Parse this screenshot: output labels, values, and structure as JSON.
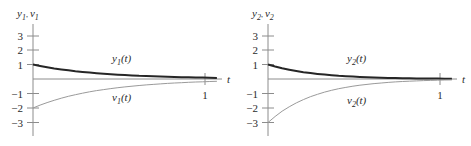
{
  "figure": {
    "title": "",
    "background_color": "#ffffff",
    "panel_count": 2
  },
  "chart_data": [
    {
      "type": "line",
      "panel_id": "left",
      "title": "",
      "xlabel": "t",
      "ylabel": "y1, v1",
      "ylabel_parts": {
        "first": "y",
        "first_sub": "1",
        "sep": ", ",
        "second": "v",
        "second_sub": "1"
      },
      "xlim": [
        0,
        1.32
      ],
      "ylim": [
        -3.4,
        3.4
      ],
      "xticks": [
        1
      ],
      "xticklabels": [
        "1"
      ],
      "yticks": [
        3,
        2,
        1,
        -1,
        -2,
        -3
      ],
      "yticklabels": [
        "3",
        "2",
        "1",
        "−1",
        "−2",
        "−3"
      ],
      "grid": false,
      "legend": "inline-annotations",
      "series": [
        {
          "name": "y1(t)",
          "name_parts": {
            "base": "y",
            "sub": "1",
            "arg": "(t)"
          },
          "color": "#262626",
          "width": 2.0,
          "annotation_x": 0.6,
          "annotation_y": 0.95,
          "x": [
            0,
            0.05,
            0.1,
            0.15,
            0.2,
            0.25,
            0.3,
            0.35,
            0.4,
            0.45,
            0.5,
            0.55,
            0.6,
            0.65,
            0.7,
            0.75,
            0.8,
            0.85,
            0.9,
            0.95,
            1.0,
            1.05,
            1.1,
            1.15,
            1.2,
            1.25,
            1.3
          ],
          "y": [
            1.0,
            0.901,
            0.813,
            0.733,
            0.662,
            0.598,
            0.541,
            0.489,
            0.443,
            0.401,
            0.364,
            0.33,
            0.3,
            0.272,
            0.247,
            0.224,
            0.204,
            0.185,
            0.168,
            0.153,
            0.139,
            0.126,
            0.115,
            0.104,
            0.095,
            0.086,
            0.078
          ]
        },
        {
          "name": "v1(t)",
          "name_parts": {
            "base": "v",
            "sub": "1",
            "arg": "(t)"
          },
          "color": "#9a9a9a",
          "width": 1.0,
          "annotation_x": 0.6,
          "annotation_y": -1.05,
          "x": [
            0,
            0.05,
            0.1,
            0.15,
            0.2,
            0.25,
            0.3,
            0.35,
            0.4,
            0.45,
            0.5,
            0.55,
            0.6,
            0.65,
            0.7,
            0.75,
            0.8,
            0.85,
            0.9,
            0.95,
            1.0,
            1.05,
            1.1,
            1.15,
            1.2,
            1.25,
            1.3
          ],
          "y": [
            -2.0,
            -1.802,
            -1.626,
            -1.466,
            -1.323,
            -1.195,
            -1.082,
            -0.978,
            -0.886,
            -0.802,
            -0.728,
            -0.66,
            -0.6,
            -0.544,
            -0.494,
            -0.448,
            -0.408,
            -0.37,
            -0.336,
            -0.306,
            -0.278,
            -0.252,
            -0.23,
            -0.208,
            -0.19,
            -0.172,
            -0.156
          ]
        }
      ]
    },
    {
      "type": "line",
      "panel_id": "right",
      "title": "",
      "xlabel": "t",
      "ylabel": "y2, v2",
      "ylabel_parts": {
        "first": "y",
        "first_sub": "2",
        "sep": ", ",
        "second": "v",
        "second_sub": "2"
      },
      "xlim": [
        0,
        1.32
      ],
      "ylim": [
        -3.4,
        3.4
      ],
      "xticks": [
        1
      ],
      "xticklabels": [
        "1"
      ],
      "yticks": [
        3,
        2,
        1,
        -1,
        -2,
        -3
      ],
      "yticklabels": [
        "3",
        "2",
        "1",
        "−1",
        "−2",
        "−3"
      ],
      "grid": false,
      "legend": "inline-annotations",
      "series": [
        {
          "name": "y2(t)",
          "name_parts": {
            "base": "y",
            "sub": "2",
            "arg": "(t)"
          },
          "color": "#262626",
          "width": 2.0,
          "annotation_x": 0.6,
          "annotation_y": 0.95,
          "x": [
            0,
            0.05,
            0.1,
            0.15,
            0.2,
            0.25,
            0.3,
            0.35,
            0.4,
            0.45,
            0.5,
            0.55,
            0.6,
            0.65,
            0.7,
            0.75,
            0.8,
            0.85,
            0.9,
            0.95,
            1.0,
            1.05,
            1.1,
            1.15,
            1.2,
            1.25,
            1.3
          ],
          "y": [
            1.0,
            0.861,
            0.741,
            0.638,
            0.55,
            0.472,
            0.407,
            0.35,
            0.301,
            0.259,
            0.223,
            0.192,
            0.165,
            0.142,
            0.122,
            0.105,
            0.091,
            0.078,
            0.067,
            0.058,
            0.05,
            0.043,
            0.037,
            0.032,
            0.027,
            0.023,
            0.02
          ]
        },
        {
          "name": "v2(t)",
          "name_parts": {
            "base": "v",
            "sub": "2",
            "arg": "(t)"
          },
          "color": "#9a9a9a",
          "width": 1.0,
          "annotation_x": 0.6,
          "annotation_y": -1.25,
          "x": [
            0,
            0.05,
            0.1,
            0.15,
            0.2,
            0.25,
            0.3,
            0.35,
            0.4,
            0.45,
            0.5,
            0.55,
            0.6,
            0.65,
            0.7,
            0.75,
            0.8,
            0.85,
            0.9,
            0.95,
            1.0,
            1.05,
            1.1,
            1.15,
            1.2,
            1.25,
            1.3
          ],
          "y": [
            -3.0,
            -2.583,
            -2.224,
            -1.915,
            -1.649,
            -1.42,
            -1.222,
            -1.052,
            -0.906,
            -0.78,
            -0.671,
            -0.578,
            -0.498,
            -0.429,
            -0.369,
            -0.318,
            -0.273,
            -0.235,
            -0.203,
            -0.174,
            -0.15,
            -0.129,
            -0.111,
            -0.096,
            -0.082,
            -0.071,
            -0.061
          ]
        }
      ]
    }
  ]
}
